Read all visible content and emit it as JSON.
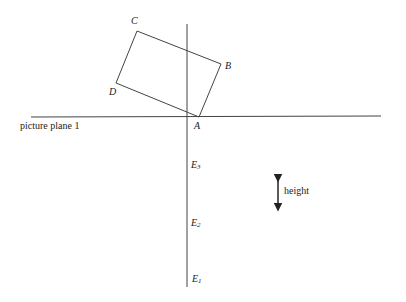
{
  "diagram": {
    "corners": {
      "A": "A",
      "B": "B",
      "C": "C",
      "D": "D"
    },
    "picture_plane_label": "picture plane 1",
    "eye_points": [
      {
        "base": "E",
        "sub": "3"
      },
      {
        "base": "E",
        "sub": "2"
      },
      {
        "base": "E",
        "sub": "1"
      }
    ],
    "height_label": "height"
  }
}
